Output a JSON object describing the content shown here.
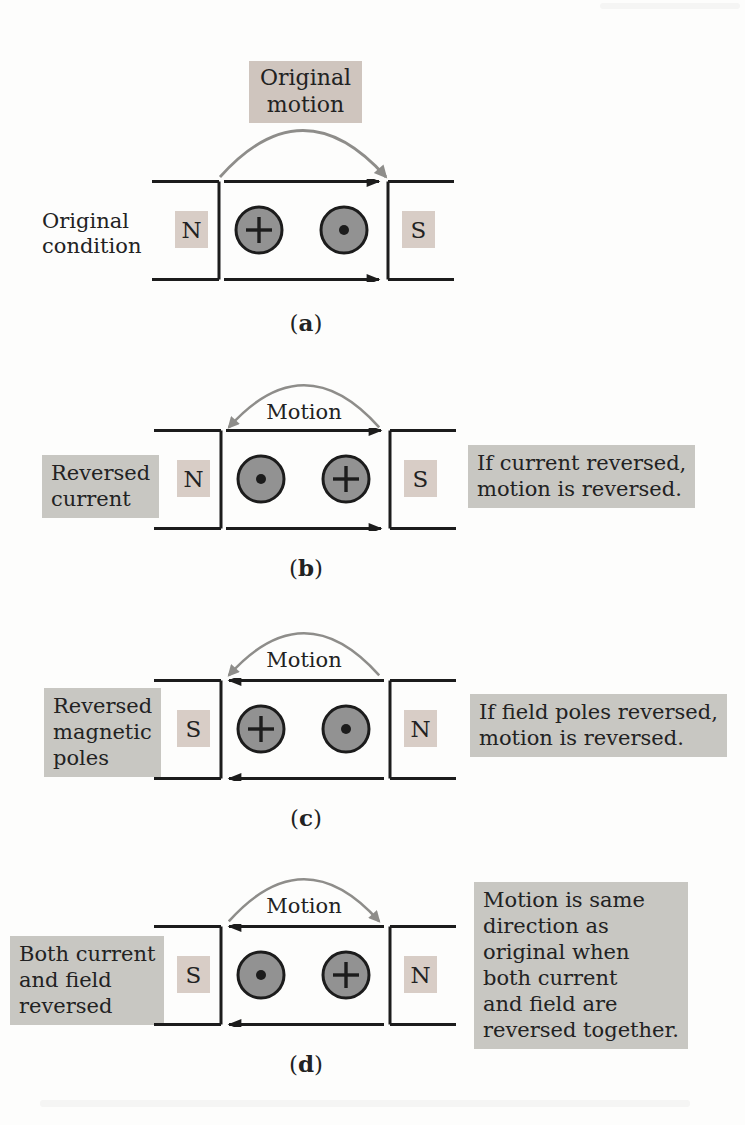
{
  "figure": {
    "type": "physics-diagram"
  },
  "colors": {
    "background": "#fdfdfc",
    "line": "#1c1c1c",
    "text": "#222222",
    "motion_arrow": "#8e8d8a",
    "conductor_fill": "#929292",
    "conductor_stroke": "#1c1c1c",
    "pole_box": "#d8cdc6",
    "highlight_box": "#c8c7c2",
    "top_label_box": "#cfc5be"
  },
  "panels": [
    {
      "id": "a",
      "caption": {
        "open": "(",
        "letter": "a",
        "close": ")"
      },
      "top_label": "Original\nmotion",
      "side_label": "Original\ncondition",
      "side_label_highlighted": false,
      "left_pole": "N",
      "right_pole": "S",
      "left_conductor": "cross",
      "right_conductor": "dot",
      "field_direction": "right",
      "motion_direction": "right"
    },
    {
      "id": "b",
      "caption": {
        "open": "(",
        "letter": "b",
        "close": ")"
      },
      "motion_label": "Motion",
      "side_label": "Reversed\ncurrent",
      "side_label_highlighted": true,
      "left_pole": "N",
      "right_pole": "S",
      "left_conductor": "dot",
      "right_conductor": "cross",
      "field_direction": "right",
      "motion_direction": "left",
      "note": "If current reversed,\nmotion is reversed."
    },
    {
      "id": "c",
      "caption": {
        "open": "(",
        "letter": "c",
        "close": ")"
      },
      "motion_label": "Motion",
      "side_label": "Reversed\nmagnetic\npoles",
      "side_label_highlighted": true,
      "left_pole": "S",
      "right_pole": "N",
      "left_conductor": "cross",
      "right_conductor": "dot",
      "field_direction": "left",
      "motion_direction": "left",
      "note": "If field poles reversed,\nmotion is reversed."
    },
    {
      "id": "d",
      "caption": {
        "open": "(",
        "letter": "d",
        "close": ")"
      },
      "motion_label": "Motion",
      "side_label": "Both current\nand field\nreversed",
      "side_label_highlighted": true,
      "left_pole": "S",
      "right_pole": "N",
      "left_conductor": "dot",
      "right_conductor": "cross",
      "field_direction": "left",
      "motion_direction": "right",
      "note": "Motion is same\ndirection as\noriginal when\nboth current\nand field are\nreversed together."
    }
  ]
}
